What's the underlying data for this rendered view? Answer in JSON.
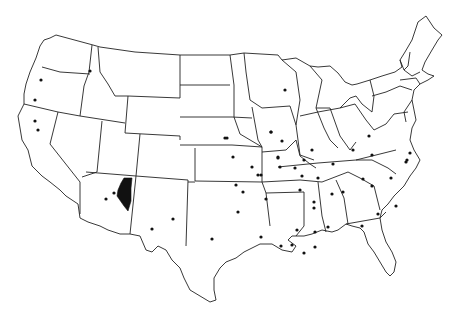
{
  "map": {
    "type": "outline map",
    "region": "Contiguous United States",
    "features": [
      "state borders",
      "location dots",
      "highlighted region"
    ],
    "colors": {
      "background": "#ffffff",
      "outline": "#222222",
      "dots": "#111111",
      "highlight": "#111111"
    },
    "highlighted_region": {
      "state": "Arizona",
      "description": "Filled black area in north-central/east Arizona",
      "points": "124,178 121,183 118,190 117,196 124,206 128,211 131,201 131,188 132,178"
    },
    "dots": [
      {
        "x": 41,
        "y": 80
      },
      {
        "x": 35,
        "y": 100
      },
      {
        "x": 35,
        "y": 121
      },
      {
        "x": 38,
        "y": 130
      },
      {
        "x": 90,
        "y": 71
      },
      {
        "x": 225,
        "y": 138
      },
      {
        "x": 114,
        "y": 193
      },
      {
        "x": 106,
        "y": 199
      },
      {
        "x": 173,
        "y": 219
      },
      {
        "x": 152,
        "y": 229
      },
      {
        "x": 212,
        "y": 239
      },
      {
        "x": 285,
        "y": 90
      },
      {
        "x": 271,
        "y": 132
      },
      {
        "x": 282,
        "y": 141
      },
      {
        "x": 278,
        "y": 157
      },
      {
        "x": 278,
        "y": 158
      },
      {
        "x": 227,
        "y": 138
      },
      {
        "x": 271,
        "y": 132
      },
      {
        "x": 312,
        "y": 150
      },
      {
        "x": 304,
        "y": 160
      },
      {
        "x": 302,
        "y": 176
      },
      {
        "x": 318,
        "y": 178
      },
      {
        "x": 333,
        "y": 164
      },
      {
        "x": 369,
        "y": 136
      },
      {
        "x": 353,
        "y": 150
      },
      {
        "x": 372,
        "y": 155
      },
      {
        "x": 406,
        "y": 162
      },
      {
        "x": 407,
        "y": 160
      },
      {
        "x": 233,
        "y": 157
      },
      {
        "x": 258,
        "y": 175
      },
      {
        "x": 236,
        "y": 185
      },
      {
        "x": 252,
        "y": 167
      },
      {
        "x": 261,
        "y": 175
      },
      {
        "x": 243,
        "y": 192
      },
      {
        "x": 280,
        "y": 167
      },
      {
        "x": 295,
        "y": 168
      },
      {
        "x": 300,
        "y": 190
      },
      {
        "x": 314,
        "y": 208
      },
      {
        "x": 332,
        "y": 194
      },
      {
        "x": 328,
        "y": 227
      },
      {
        "x": 297,
        "y": 230
      },
      {
        "x": 266,
        "y": 199
      },
      {
        "x": 238,
        "y": 212
      },
      {
        "x": 261,
        "y": 237
      },
      {
        "x": 281,
        "y": 246
      },
      {
        "x": 292,
        "y": 245
      },
      {
        "x": 304,
        "y": 253
      },
      {
        "x": 315,
        "y": 247
      },
      {
        "x": 315,
        "y": 232
      },
      {
        "x": 314,
        "y": 202
      },
      {
        "x": 343,
        "y": 192
      },
      {
        "x": 363,
        "y": 179
      },
      {
        "x": 372,
        "y": 186
      },
      {
        "x": 391,
        "y": 178
      },
      {
        "x": 378,
        "y": 214
      },
      {
        "x": 362,
        "y": 226
      },
      {
        "x": 396,
        "y": 206
      },
      {
        "x": 410,
        "y": 153
      }
    ]
  }
}
